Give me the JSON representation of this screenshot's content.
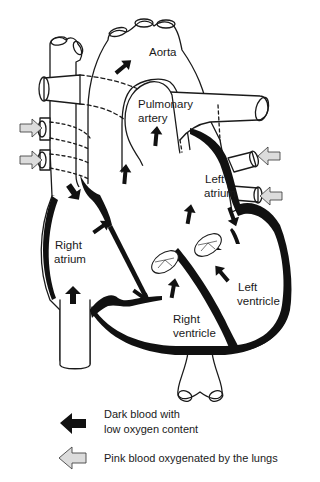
{
  "diagram": {
    "type": "heart-anatomy",
    "labels": {
      "aorta": "Aorta",
      "pulmonary_artery_1": "Pulmonary",
      "pulmonary_artery_2": "artery",
      "left_atrium_1": "Left",
      "left_atrium_2": "atrium",
      "right_atrium_1": "Right",
      "right_atrium_2": "atrium",
      "left_ventricle_1": "Left",
      "left_ventricle_2": "ventricle",
      "right_ventricle_1": "Right",
      "right_ventricle_2": "ventricle"
    },
    "colors": {
      "outline": "#1a1a1a",
      "dark_blood": "#111111",
      "pink_blood_arrow": "#d8d8d8",
      "background": "#ffffff"
    }
  },
  "legend": {
    "items": [
      {
        "icon": "dark-arrow-icon",
        "line1": "Dark blood with",
        "line2": "low oxygen content"
      },
      {
        "icon": "light-arrow-icon",
        "line1": "Pink blood oxygenated by the lungs"
      }
    ]
  }
}
